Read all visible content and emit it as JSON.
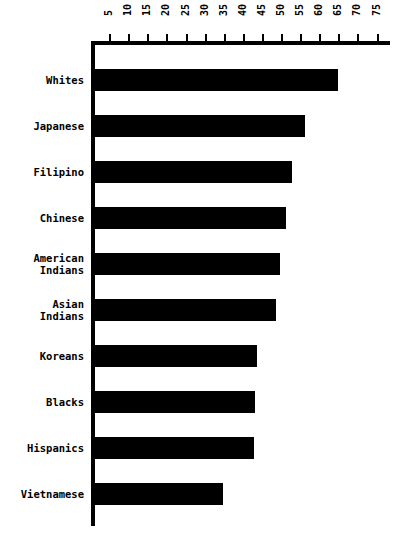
{
  "chart_data": {
    "type": "bar",
    "orientation": "horizontal",
    "title": "",
    "subtitle": "",
    "xlabel": "",
    "ylabel": "",
    "grid": false,
    "legend": false,
    "legend_position": "none",
    "xlim": [
      0,
      78
    ],
    "categories": [
      "Whites",
      "Japanese",
      "Filipino",
      "Chinese",
      "American Indians",
      "Asian Indians",
      "Koreans",
      "Blacks",
      "Hispanics",
      "Vietnamese"
    ],
    "category_labels_multiline": [
      "Whites",
      "Japanese",
      "Filipino",
      "Chinese",
      "American\nIndians",
      "Asian\nIndians",
      "Koreans",
      "Blacks",
      "Hispanics",
      "Vietnamese"
    ],
    "values": [
      63.5,
      55,
      51.5,
      50,
      48.5,
      47.5,
      42.5,
      42,
      41.5,
      33.5
    ],
    "xticks": [
      5,
      10,
      15,
      20,
      25,
      30,
      35,
      40,
      45,
      50,
      55,
      60,
      65,
      70,
      75
    ],
    "xtick_labels": [
      "5",
      "10",
      "15",
      "20",
      "25",
      "30",
      "35",
      "40",
      "45",
      "50",
      "55",
      "60",
      "65",
      "70",
      "75"
    ],
    "tick_label_rotation_deg": -90,
    "bar_color": "#000000",
    "background_color": "#ffffff",
    "axis_color": "#000000"
  },
  "geometry": {
    "axis_origin_x": 91,
    "axis_top_y": 41,
    "pixels_per_unit": 3.82,
    "row_pitch": 46,
    "first_bar_y": 69,
    "bar_height": 22
  }
}
